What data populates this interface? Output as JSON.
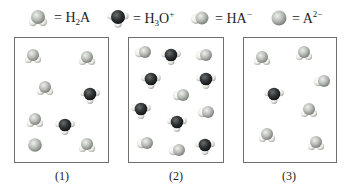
{
  "legend": [
    {
      "species": "H2A",
      "label_main": "H",
      "label_sub": "2",
      "label_rest": "A",
      "label_sup": "",
      "icon": "h2a-molecule-icon"
    },
    {
      "species": "H3O+",
      "label_main": "H",
      "label_sub": "3",
      "label_rest": "O",
      "label_sup": "+",
      "icon": "hydronium-molecule-icon"
    },
    {
      "species": "HA-",
      "label_main": "HA",
      "label_sub": "",
      "label_rest": "",
      "label_sup": "−",
      "icon": "ha-minus-molecule-icon"
    },
    {
      "species": "A2-",
      "label_main": "A",
      "label_sub": "",
      "label_rest": "",
      "label_sup": "2−",
      "icon": "a2-minus-ion-icon"
    }
  ],
  "equals": "=",
  "colors": {
    "a_atom": "#b9bdb8",
    "h_atom": "#f2f2ee",
    "o_atom": "#2f3333",
    "border": "#6f6f6f"
  },
  "boxes": [
    {
      "label": "(1)",
      "molecules": [
        {
          "type": "H2A",
          "x": 18,
          "y": 18
        },
        {
          "type": "H2A",
          "x": 72,
          "y": 20
        },
        {
          "type": "H2A",
          "x": 30,
          "y": 50
        },
        {
          "type": "H3O+",
          "x": 75,
          "y": 57
        },
        {
          "type": "H2A",
          "x": 20,
          "y": 82
        },
        {
          "type": "H3O+",
          "x": 50,
          "y": 88
        },
        {
          "type": "A2-",
          "x": 20,
          "y": 107
        },
        {
          "type": "H2A",
          "x": 72,
          "y": 107
        }
      ]
    },
    {
      "label": "(2)",
      "molecules": [
        {
          "type": "HA-",
          "x": 14,
          "y": 14
        },
        {
          "type": "H3O+",
          "x": 42,
          "y": 18
        },
        {
          "type": "HA-",
          "x": 75,
          "y": 17
        },
        {
          "type": "H3O+",
          "x": 22,
          "y": 42
        },
        {
          "type": "H3O+",
          "x": 77,
          "y": 42
        },
        {
          "type": "HA-",
          "x": 52,
          "y": 57
        },
        {
          "type": "H3O+",
          "x": 12,
          "y": 72
        },
        {
          "type": "HA-",
          "x": 77,
          "y": 74
        },
        {
          "type": "H3O+",
          "x": 48,
          "y": 85
        },
        {
          "type": "HA-",
          "x": 16,
          "y": 105
        },
        {
          "type": "HA-",
          "x": 48,
          "y": 112
        },
        {
          "type": "H3O+",
          "x": 76,
          "y": 108
        }
      ]
    },
    {
      "label": "(3)",
      "molecules": [
        {
          "type": "H2A",
          "x": 18,
          "y": 20
        },
        {
          "type": "H2A",
          "x": 60,
          "y": 15
        },
        {
          "type": "HA-",
          "x": 78,
          "y": 43
        },
        {
          "type": "H3O+",
          "x": 30,
          "y": 57
        },
        {
          "type": "H2A",
          "x": 65,
          "y": 72
        },
        {
          "type": "H2A",
          "x": 23,
          "y": 97
        },
        {
          "type": "H2A",
          "x": 72,
          "y": 105
        }
      ]
    }
  ]
}
